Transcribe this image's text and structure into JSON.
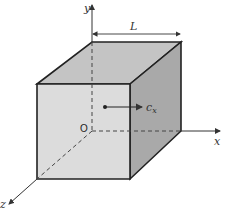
{
  "diagram": {
    "labels": {
      "y_axis": "y",
      "x_axis": "x",
      "z_axis": "z",
      "origin": "O",
      "length": "L",
      "velocity_symbol": "c",
      "velocity_subscript": "x"
    },
    "colors": {
      "front_face": "#dcdcdc",
      "top_face": "#c4c4c4",
      "right_face": "#a9a9a9",
      "edge": "#222222",
      "axis": "#333333"
    }
  }
}
